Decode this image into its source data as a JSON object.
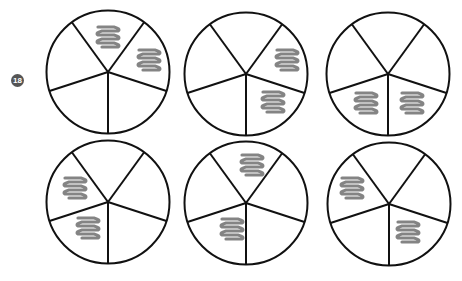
{
  "exercise": {
    "number_label": "18",
    "badge_color": "#555555"
  },
  "style": {
    "stroke_color": "#111111",
    "stroke_width": 2,
    "shade_color": "#777777"
  },
  "geometry": {
    "radius": 61.5,
    "spoke_angles_deg": [
      90,
      162,
      234,
      306,
      18
    ],
    "sector_names": [
      "lower-left",
      "upper-left",
      "top",
      "upper-right",
      "lower-right"
    ]
  },
  "circles": [
    {
      "id": 1,
      "cx": 108,
      "cy": 72,
      "shaded_sectors": [
        "top",
        "upper-right"
      ],
      "scribbles": [
        [
          108,
          37
        ],
        [
          149,
          60
        ]
      ]
    },
    {
      "id": 2,
      "cx": 246,
      "cy": 74,
      "shaded_sectors": [
        "upper-right",
        "lower-right"
      ],
      "scribbles": [
        [
          287,
          60
        ],
        [
          273,
          102
        ]
      ]
    },
    {
      "id": 3,
      "cx": 388,
      "cy": 74,
      "shaded_sectors": [
        "lower-left",
        "lower-right"
      ],
      "scribbles": [
        [
          366,
          103
        ],
        [
          412,
          103
        ]
      ]
    },
    {
      "id": 4,
      "cx": 108,
      "cy": 202,
      "shaded_sectors": [
        "upper-left",
        "lower-left"
      ],
      "scribbles": [
        [
          75,
          188
        ],
        [
          88,
          228
        ]
      ]
    },
    {
      "id": 5,
      "cx": 246,
      "cy": 203,
      "shaded_sectors": [
        "top",
        "lower-left"
      ],
      "scribbles": [
        [
          252,
          165
        ],
        [
          232,
          229
        ]
      ]
    },
    {
      "id": 6,
      "cx": 389,
      "cy": 204,
      "shaded_sectors": [
        "upper-left",
        "lower-right"
      ],
      "scribbles": [
        [
          352,
          188
        ],
        [
          408,
          232
        ]
      ]
    }
  ]
}
